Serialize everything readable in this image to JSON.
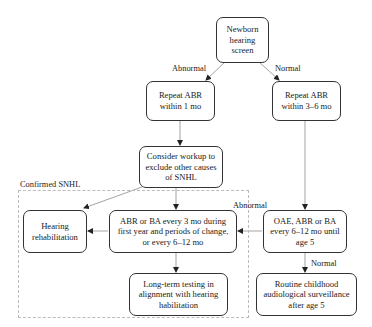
{
  "diagram": {
    "type": "flowchart",
    "region": {
      "label": "Confirmed SNHL"
    },
    "nodes": {
      "newborn": "Newborn hearing screen",
      "repeat1": "Repeat ABR within 1 mo",
      "repeat36": "Repeat ABR within 3–6 mo",
      "workup": "Consider workup to exclude other causes of SNHL",
      "rehab": "Hearing rehabilitation",
      "abrba": "ABR or BA every 3 mo during first year and periods of change, or every 6–12 mo",
      "longterm": "Long-term testing in alignment with hearing habilitation",
      "oae": "OAE, ABR or BA every 6–12 mo until age 5",
      "routine": "Routine childhood audiological surveillance after age 5"
    },
    "edge_labels": {
      "abnormal1": "Abnormal",
      "normal1": "Normal",
      "abnormal2": "Abnormal",
      "normal2": "Normal"
    },
    "edges": [
      {
        "from": "newborn",
        "to": "repeat1",
        "label": "Abnormal"
      },
      {
        "from": "newborn",
        "to": "repeat36",
        "label": "Normal"
      },
      {
        "from": "repeat1",
        "to": "workup"
      },
      {
        "from": "repeat36",
        "to": "oae"
      },
      {
        "from": "workup",
        "to": "rehab"
      },
      {
        "from": "workup",
        "to": "abrba"
      },
      {
        "from": "abrba",
        "to": "rehab"
      },
      {
        "from": "abrba",
        "to": "longterm"
      },
      {
        "from": "oae",
        "to": "abrba",
        "label": "Abnormal"
      },
      {
        "from": "oae",
        "to": "routine",
        "label": "Normal"
      }
    ]
  }
}
